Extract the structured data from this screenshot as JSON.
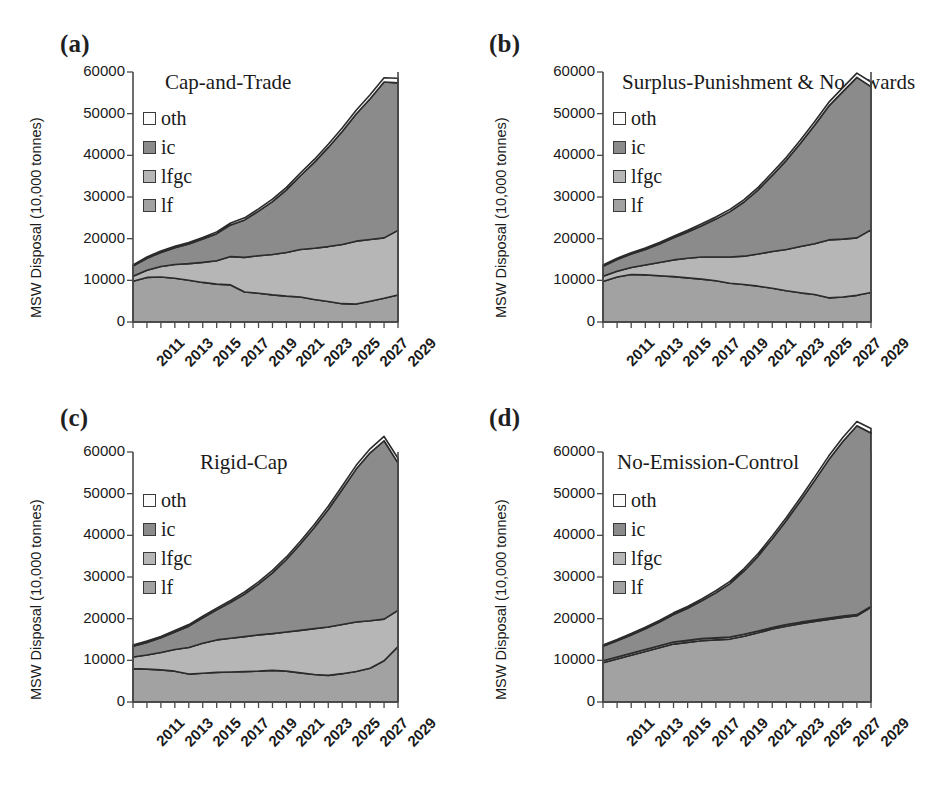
{
  "figure": {
    "panel_count": 4,
    "shared_ylabel": "MSW Disposal (10,000 tonnes)",
    "shared_yticks": [
      "0",
      "10000",
      "20000",
      "30000",
      "40000",
      "50000",
      "60000"
    ],
    "shared_xticks": [
      "2011",
      "2013",
      "2015",
      "2017",
      "2019",
      "2021",
      "2023",
      "2025",
      "2027",
      "2029"
    ],
    "legend_labels": [
      "oth",
      "ic",
      "lfgc",
      "lf"
    ],
    "colors": {
      "oth": "#fbfbfb",
      "ic": "#8b8b8b",
      "lfgc": "#b6b6b6",
      "lf": "#a2a2a2",
      "outline": "#2b2b2b",
      "axis": "#4a4a4a",
      "text": "#1a1a1a"
    }
  },
  "panels": [
    {
      "tag": "(a)",
      "title": "Cap-and-Trade"
    },
    {
      "tag": "(b)",
      "title": "Surplus-Punishment & No-Awards"
    },
    {
      "tag": "(c)",
      "title": "Rigid-Cap"
    },
    {
      "tag": "(d)",
      "title": "No-Emission-Control"
    }
  ],
  "chart_data": [
    {
      "type": "area",
      "stacked": true,
      "title": "Cap-and-Trade",
      "panel": "(a)",
      "xlabel": "",
      "ylabel": "MSW Disposal (10,000 tonnes)",
      "ylim": [
        0,
        60000
      ],
      "grid": false,
      "legend_position": "upper-left",
      "x": [
        2011,
        2012,
        2013,
        2014,
        2015,
        2016,
        2017,
        2018,
        2019,
        2020,
        2021,
        2022,
        2023,
        2024,
        2025,
        2026,
        2027,
        2028,
        2029,
        2030
      ],
      "series": [
        {
          "name": "lf",
          "values": [
            9800,
            10700,
            10800,
            10500,
            10000,
            9500,
            9100,
            8900,
            7200,
            6900,
            6500,
            6200,
            6000,
            5400,
            4900,
            4400,
            4300,
            5000,
            5700,
            6500
          ]
        },
        {
          "name": "lfgc",
          "values": [
            1200,
            1700,
            2500,
            3300,
            4000,
            4800,
            5600,
            6800,
            8300,
            9000,
            9700,
            10500,
            11400,
            12300,
            13200,
            14200,
            15100,
            14800,
            14500,
            15500
          ]
        },
        {
          "name": "ic",
          "values": [
            2400,
            2900,
            3400,
            4000,
            4700,
            5600,
            6500,
            7600,
            9000,
            10700,
            12700,
            15000,
            17700,
            20600,
            23800,
            27100,
            30500,
            33800,
            37400,
            35400
          ]
        },
        {
          "name": "oth",
          "values": [
            300,
            320,
            340,
            360,
            380,
            400,
            430,
            460,
            500,
            540,
            580,
            620,
            670,
            720,
            780,
            840,
            900,
            960,
            1030,
            1100
          ]
        }
      ],
      "series_totals": [
        13700,
        15620,
        17040,
        18160,
        19080,
        20300,
        21630,
        23760,
        25000,
        27140,
        29480,
        32320,
        35770,
        39020,
        42680,
        46540,
        50800,
        54560,
        58630,
        58500
      ]
    },
    {
      "type": "area",
      "stacked": true,
      "title": "Surplus-Punishment & No-Awards",
      "panel": "(b)",
      "xlabel": "",
      "ylabel": "MSW Disposal (10,000 tonnes)",
      "ylim": [
        0,
        60000
      ],
      "grid": false,
      "legend_position": "upper-left",
      "x": [
        2011,
        2012,
        2013,
        2014,
        2015,
        2016,
        2017,
        2018,
        2019,
        2020,
        2021,
        2022,
        2023,
        2024,
        2025,
        2026,
        2027,
        2028,
        2029,
        2030
      ],
      "series": [
        {
          "name": "lf",
          "values": [
            9700,
            10800,
            11400,
            11300,
            11100,
            10900,
            10600,
            10300,
            9900,
            9300,
            9000,
            8600,
            8100,
            7500,
            7000,
            6600,
            5800,
            6000,
            6400,
            7100
          ]
        },
        {
          "name": "lfgc",
          "values": [
            1300,
            1400,
            1700,
            2400,
            3200,
            4000,
            4700,
            5300,
            5700,
            6300,
            6800,
            7700,
            8800,
            9900,
            11100,
            12200,
            13900,
            13900,
            13800,
            15000
          ]
        },
        {
          "name": "ic",
          "values": [
            2400,
            2800,
            3200,
            3700,
            4400,
            5300,
            6300,
            7500,
            9100,
            10900,
            13000,
            15400,
            18300,
            21400,
            24800,
            28400,
            32100,
            35400,
            38500,
            34400
          ]
        },
        {
          "name": "oth",
          "values": [
            300,
            320,
            340,
            360,
            380,
            400,
            430,
            460,
            500,
            540,
            580,
            620,
            670,
            720,
            780,
            840,
            900,
            960,
            1030,
            1100
          ]
        }
      ],
      "series_totals": [
        13700,
        15320,
        16640,
        17760,
        19080,
        20600,
        22030,
        23560,
        25200,
        27040,
        29380,
        32320,
        35870,
        39520,
        43680,
        48040,
        52700,
        56260,
        59730,
        57600
      ]
    },
    {
      "type": "area",
      "stacked": true,
      "title": "Rigid-Cap",
      "panel": "(c)",
      "xlabel": "",
      "ylabel": "MSW Disposal (10,000 tonnes)",
      "ylim": [
        0,
        60000
      ],
      "grid": false,
      "legend_position": "upper-left",
      "x": [
        2011,
        2012,
        2013,
        2014,
        2015,
        2016,
        2017,
        2018,
        2019,
        2020,
        2021,
        2022,
        2023,
        2024,
        2025,
        2026,
        2027,
        2028,
        2029,
        2030
      ],
      "series": [
        {
          "name": "lf",
          "values": [
            8000,
            7900,
            7700,
            7400,
            6700,
            6900,
            7100,
            7200,
            7300,
            7400,
            7600,
            7400,
            7000,
            6600,
            6400,
            6800,
            7300,
            8100,
            9900,
            13300
          ]
        },
        {
          "name": "lfgc",
          "values": [
            2800,
            3400,
            4200,
            5200,
            6400,
            7200,
            7800,
            8100,
            8400,
            8700,
            8800,
            9400,
            10200,
            11000,
            11600,
            11800,
            11900,
            11400,
            10000,
            8700
          ]
        },
        {
          "name": "ic",
          "values": [
            2600,
            3000,
            3500,
            4200,
            5100,
            6100,
            7200,
            8600,
            10200,
            12200,
            14600,
            17400,
            20700,
            24300,
            28200,
            32400,
            36700,
            40300,
            42800,
            35400
          ]
        },
        {
          "name": "oth",
          "values": [
            300,
            320,
            340,
            360,
            380,
            400,
            430,
            460,
            500,
            540,
            580,
            620,
            670,
            720,
            780,
            840,
            900,
            960,
            1030,
            1100
          ]
        }
      ],
      "series_totals": [
        13700,
        14620,
        15740,
        17160,
        18580,
        20600,
        22530,
        24360,
        26400,
        28840,
        31580,
        34820,
        38570,
        42620,
        46980,
        51840,
        56800,
        60760,
        63730,
        58500
      ]
    },
    {
      "type": "area",
      "stacked": true,
      "title": "No-Emission-Control",
      "panel": "(d)",
      "xlabel": "",
      "ylabel": "MSW Disposal (10,000 tonnes)",
      "ylim": [
        0,
        60000
      ],
      "grid": false,
      "legend_position": "upper-left",
      "x": [
        2011,
        2012,
        2013,
        2014,
        2015,
        2016,
        2017,
        2018,
        2019,
        2020,
        2021,
        2022,
        2023,
        2024,
        2025,
        2026,
        2027,
        2028,
        2029,
        2030
      ],
      "series": [
        {
          "name": "lf",
          "values": [
            9400,
            10300,
            11200,
            12100,
            13000,
            13900,
            14300,
            14700,
            14900,
            15100,
            15800,
            16600,
            17500,
            18200,
            18800,
            19300,
            19800,
            20300,
            20700,
            22700
          ]
        },
        {
          "name": "lfgc",
          "values": [
            500,
            500,
            500,
            500,
            500,
            500,
            500,
            500,
            500,
            500,
            450,
            420,
            400,
            380,
            360,
            340,
            320,
            300,
            280,
            260
          ]
        },
        {
          "name": "ic",
          "values": [
            3500,
            3900,
            4400,
            5000,
            5700,
            6600,
            7700,
            9100,
            10800,
            12800,
            15200,
            18000,
            21300,
            25000,
            29100,
            33500,
            38000,
            41900,
            45300,
            41600
          ]
        },
        {
          "name": "oth",
          "values": [
            300,
            320,
            340,
            360,
            380,
            400,
            430,
            460,
            500,
            540,
            580,
            620,
            670,
            720,
            780,
            840,
            900,
            960,
            1030,
            1100
          ]
        }
      ],
      "series_totals": [
        13700,
        15020,
        16440,
        17960,
        19580,
        21400,
        22930,
        24760,
        26700,
        28940,
        32030,
        35640,
        39870,
        44300,
        49040,
        53980,
        59020,
        63460,
        67310,
        65660
      ]
    }
  ]
}
